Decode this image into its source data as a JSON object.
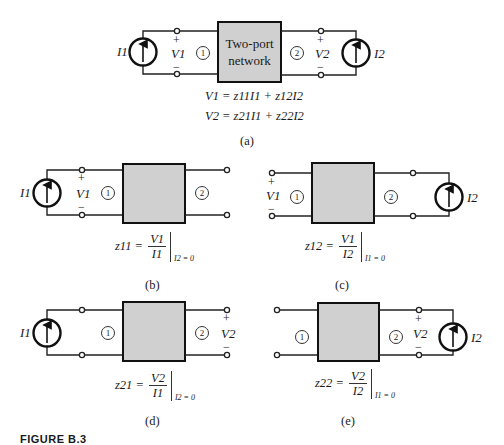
{
  "figure": {
    "caption_prefix": "FIGURE B.3",
    "box_fill": "#d0d0d0"
  },
  "panel_a": {
    "label": "(a)",
    "box_text_line1": "Two-port",
    "box_text_line2": "network",
    "source_left": "I1",
    "source_right": "I2",
    "port1_marker": "1",
    "port2_marker": "2",
    "v1": "V1",
    "v2": "V2",
    "plus": "+",
    "minus": "−",
    "eq1": {
      "lhs": "V1",
      "t1c": "z11",
      "t1v": "I1",
      "t2c": "z12",
      "t2v": "I2"
    },
    "eq2": {
      "lhs": "V2",
      "t1c": "z21",
      "t1v": "I1",
      "t2c": "z22",
      "t2v": "I2"
    }
  },
  "panel_b": {
    "label": "(b)",
    "param": "z11",
    "num": "V1",
    "den": "I1",
    "condition": "I2 = 0",
    "source": "I1",
    "voltage": "V1"
  },
  "panel_c": {
    "label": "(c)",
    "param": "z12",
    "num": "V1",
    "den": "I2",
    "condition": "I1 = 0",
    "source": "I2",
    "voltage": "V1"
  },
  "panel_d": {
    "label": "(d)",
    "param": "z21",
    "num": "V2",
    "den": "I1",
    "condition": "I2 = 0",
    "source": "I1",
    "voltage": "V2"
  },
  "panel_e": {
    "label": "(e)",
    "param": "z22",
    "num": "V2",
    "den": "I2",
    "condition": "I1 = 0",
    "source": "I2",
    "voltage": "V2"
  }
}
